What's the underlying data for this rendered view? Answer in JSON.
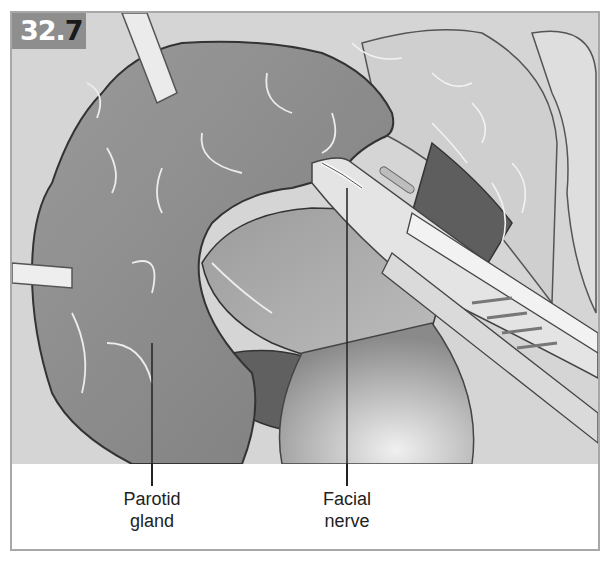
{
  "figure": {
    "number_prefix": "32.",
    "number_suffix": "7",
    "labels": [
      {
        "line1": "Parotid",
        "line2": "gland"
      },
      {
        "line1": "Facial",
        "line2": "nerve"
      }
    ]
  },
  "colors": {
    "gland": "#8c8c8c",
    "background_tissue": "#d4d4d4",
    "dark_cavity": "#5e5e5e",
    "instrument": "#e2e2e2",
    "badge": "#8e8e8e"
  }
}
